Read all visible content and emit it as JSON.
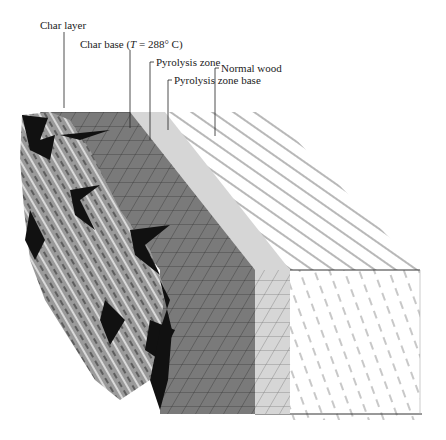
{
  "figure": {
    "labels": [
      {
        "id": "char-layer",
        "text": "Char layer"
      },
      {
        "id": "char-base",
        "text_before": "Char base (",
        "text_italic": "T",
        "text_after": " = 288° C)"
      },
      {
        "id": "pyrolysis-zone",
        "text": "Pyrolysis zone"
      },
      {
        "id": "pyrolysis-zone-base",
        "text": "Pyrolysis zone base"
      },
      {
        "id": "normal-wood",
        "text": "Normal wood"
      }
    ],
    "colors": {
      "char_dark": "#111111",
      "char_mid": "#8a8a8a",
      "char_base": "#7a7a7a",
      "pyrolysis": "#d6d6d6",
      "normal_wood": "#ffffff",
      "grain_lines": "#333333"
    }
  }
}
